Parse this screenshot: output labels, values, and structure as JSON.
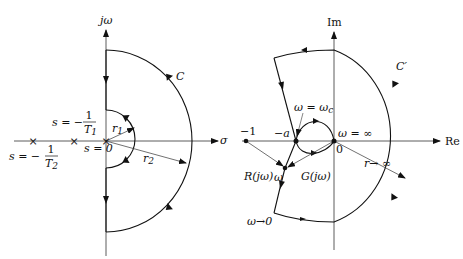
{
  "left_diagram": {
    "name": "s-plane Nyquist contour",
    "axes": {
      "vertical": "jω",
      "horizontal": "σ"
    },
    "contour_label": "C",
    "radii": {
      "inner": "r",
      "inner_sub": "1",
      "outer": "r",
      "outer_sub": "2"
    },
    "poles": [
      {
        "label_prefix": "s = −",
        "num": "1",
        "den": "T",
        "den_sub": "1"
      },
      {
        "label_prefix": "s = −",
        "num": "1",
        "den": "T",
        "den_sub": "2"
      },
      {
        "label": "s = 0"
      }
    ]
  },
  "right_diagram": {
    "name": "GH-plane Nyquist plot",
    "axes": {
      "vertical": "Im",
      "horizontal": "Re"
    },
    "contour_label": "C′",
    "points": {
      "minus_one": "−1",
      "minus_a": "−a",
      "origin": "0",
      "omega_c": "ω = ω",
      "omega_c_sub": "c",
      "omega_inf": "ω = ∞",
      "omega": "ω",
      "omega_to_zero": "ω→0",
      "r_to_inf": "r→ ∞"
    },
    "vectors": {
      "R": "R(jω)",
      "G": "G(jω)"
    }
  }
}
